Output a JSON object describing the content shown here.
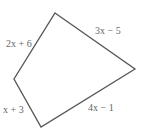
{
  "diagram": {
    "type": "quadrilateral",
    "stroke_color": "#555555",
    "vertices": [
      [
        55,
        13
      ],
      [
        135,
        69
      ],
      [
        41,
        127
      ],
      [
        14,
        79
      ]
    ],
    "sides": {
      "top_left": "2x + 6",
      "top_right": "3x − 5",
      "bottom_right": "4x − 1",
      "bottom_left": "x + 3"
    }
  }
}
